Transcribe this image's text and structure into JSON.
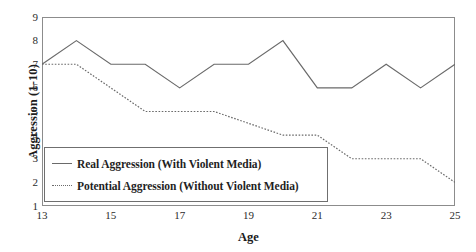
{
  "chart_data": {
    "type": "line",
    "title": "",
    "xlabel": "Age",
    "ylabel": "Aggression (1-10)",
    "xlim": [
      13,
      25
    ],
    "ylim": [
      1,
      9
    ],
    "grid": false,
    "legend_position": "lower-left-inside",
    "x": [
      13,
      14,
      15,
      16,
      17,
      18,
      19,
      20,
      21,
      22,
      23,
      24,
      25
    ],
    "xticks": [
      "13",
      "15",
      "17",
      "19",
      "21",
      "23",
      "25"
    ],
    "xtick_values": [
      13,
      15,
      17,
      19,
      21,
      23,
      25
    ],
    "yticks": [
      "1",
      "2",
      "3",
      "4",
      "5",
      "6",
      "7",
      "8",
      "9"
    ],
    "ytick_values": [
      1,
      2,
      3,
      4,
      5,
      6,
      7,
      8,
      9
    ],
    "series": [
      {
        "name": "Real Aggression (With Violent Media)",
        "style": "solid",
        "color": "#6a6a6a",
        "values": [
          7,
          8,
          7,
          7,
          6,
          7,
          7,
          8,
          6,
          6,
          7,
          6,
          7
        ]
      },
      {
        "name": "Potential Aggression (Without Violent Media)",
        "style": "dotted",
        "color": "#6a6a6a",
        "values": [
          7,
          7,
          6,
          5,
          5,
          5,
          4.5,
          4,
          4,
          3,
          3,
          3,
          2
        ]
      }
    ]
  },
  "legend": {
    "items": [
      {
        "label": "Real Aggression (With Violent Media)",
        "style": "solid"
      },
      {
        "label": "Potential Aggression (Without Violent Media)",
        "style": "dotted"
      }
    ]
  },
  "caption": {
    "text": ""
  }
}
